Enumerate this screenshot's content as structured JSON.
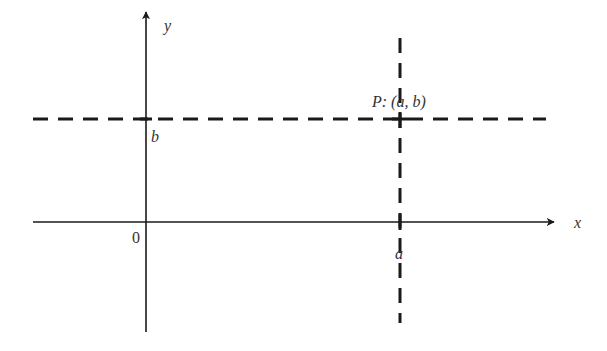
{
  "diagram": {
    "type": "cartesian-coordinate-point",
    "colors": {
      "line": "#1a1a1a",
      "text": "#333333",
      "background": "#ffffff"
    },
    "axes": {
      "x_label": "x",
      "y_label": "y",
      "origin_label": "0"
    },
    "point": {
      "name": "P",
      "label": "P: (a, b)",
      "x_label": "a",
      "y_label": "b"
    },
    "guides": [
      {
        "name": "horizontal-dashed-line",
        "equation": "y = b"
      },
      {
        "name": "vertical-dashed-line",
        "equation": "x = a"
      }
    ]
  }
}
